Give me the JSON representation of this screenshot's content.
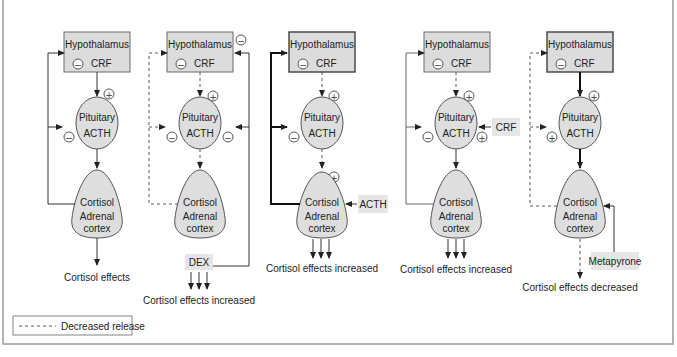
{
  "legend": {
    "decreased_release": "Decreased release"
  },
  "colors": {
    "box_fill": "#dcdcdc",
    "stroke": "#333333",
    "frame": "#9a9a9a"
  },
  "labels": {
    "hypothalamus": "Hypothalamus",
    "crf": "CRF",
    "pituitary": "Pituitary",
    "acth": "ACTH",
    "cortisol": "Cortisol",
    "adrenal": "Adrenal",
    "cortex": "cortex",
    "plus": "+",
    "minus": "−"
  },
  "panels": [
    {
      "id": "normal",
      "effect": "Cortisol effects"
    },
    {
      "id": "dex",
      "drug": "DEX",
      "effect": "Cortisol effects increased"
    },
    {
      "id": "acth",
      "drug": "ACTH",
      "effect": "Cortisol effects increased"
    },
    {
      "id": "crf",
      "drug": "CRF",
      "effect": "Cortisol effects increased"
    },
    {
      "id": "metapyrone",
      "drug": "Metapyrone",
      "effect": "Cortisol effects decreased"
    }
  ]
}
